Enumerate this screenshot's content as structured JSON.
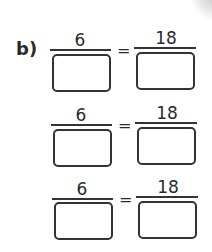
{
  "exercise": {
    "label": "b)",
    "equals_sign": "=",
    "rows": [
      {
        "left_numerator": "6",
        "left_denominator": "",
        "right_numerator": "18",
        "right_denominator": ""
      },
      {
        "left_numerator": "6",
        "left_denominator": "",
        "right_numerator": "18",
        "right_denominator": ""
      },
      {
        "left_numerator": "6",
        "left_denominator": "",
        "right_numerator": "18",
        "right_denominator": ""
      }
    ]
  }
}
